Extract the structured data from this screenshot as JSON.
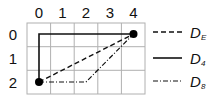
{
  "diagram": {
    "columns": [
      "0",
      "1",
      "2",
      "3",
      "4"
    ],
    "rows": [
      "0",
      "1",
      "2"
    ],
    "points": [
      {
        "name": "start",
        "col": 0,
        "row": 2
      },
      {
        "name": "end",
        "col": 4,
        "row": 0
      }
    ],
    "paths": [
      {
        "name": "D_E",
        "style": "dashed",
        "route": [
          [
            0,
            2
          ],
          [
            4,
            0
          ]
        ]
      },
      {
        "name": "D_4",
        "style": "solid",
        "route": [
          [
            0,
            2
          ],
          [
            0,
            0
          ],
          [
            4,
            0
          ]
        ]
      },
      {
        "name": "D_8",
        "style": "dash-dot",
        "route": [
          [
            0,
            2
          ],
          [
            2,
            2
          ],
          [
            4,
            0
          ]
        ]
      }
    ]
  },
  "legend": [
    {
      "style": "dashed",
      "label": "D",
      "sub": "E"
    },
    {
      "style": "solid",
      "label": "D",
      "sub": "4"
    },
    {
      "style": "dash-dot",
      "label": "D",
      "sub": "8"
    }
  ],
  "colors": {
    "grid": "#b0b0b0",
    "line": "#111111"
  }
}
